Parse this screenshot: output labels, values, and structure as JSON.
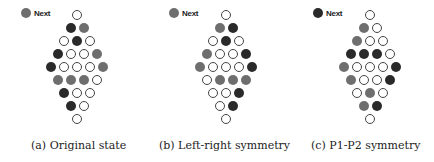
{
  "colors": {
    "black": "#2a2a2a",
    "gray": "#6e6e6e",
    "empty": "#ffffff"
  },
  "panels": [
    {
      "caption": "(a) Original state",
      "legend": {
        "label": "Next",
        "color": "gray"
      },
      "rows": [
        [
          "e"
        ],
        [
          "b",
          "g"
        ],
        [
          "e",
          "b",
          "e"
        ],
        [
          "b",
          "e",
          "e",
          "g"
        ],
        [
          "b",
          "e",
          "e",
          "e",
          "g"
        ],
        [
          "g",
          "g",
          "g",
          "e"
        ],
        [
          "b",
          "e",
          "e"
        ],
        [
          "b",
          "e"
        ],
        [
          "e"
        ]
      ]
    },
    {
      "caption": "(b) Left-right symmetry",
      "legend": {
        "label": "Next",
        "color": "gray"
      },
      "rows": [
        [
          "e"
        ],
        [
          "g",
          "b"
        ],
        [
          "e",
          "b",
          "e"
        ],
        [
          "g",
          "e",
          "e",
          "b"
        ],
        [
          "g",
          "e",
          "e",
          "e",
          "b"
        ],
        [
          "e",
          "g",
          "g",
          "g"
        ],
        [
          "e",
          "e",
          "b"
        ],
        [
          "e",
          "b"
        ],
        [
          "e"
        ]
      ]
    },
    {
      "caption": "(c) P1-P2 symmetry",
      "legend": {
        "label": "Next",
        "color": "black"
      },
      "rows": [
        [
          "e"
        ],
        [
          "g",
          "e"
        ],
        [
          "g",
          "e",
          "e"
        ],
        [
          "b",
          "b",
          "b",
          "e"
        ],
        [
          "g",
          "e",
          "e",
          "e",
          "b"
        ],
        [
          "g",
          "e",
          "e",
          "b"
        ],
        [
          "e",
          "g",
          "e"
        ],
        [
          "g",
          "b"
        ],
        [
          "e"
        ]
      ]
    }
  ]
}
